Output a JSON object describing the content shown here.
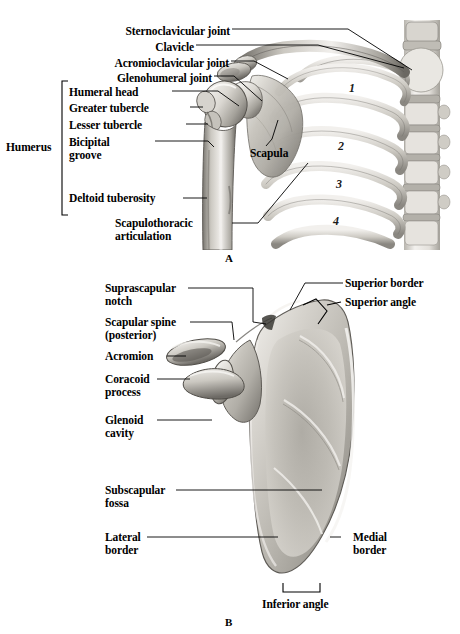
{
  "figure": {
    "title_hidden": "",
    "panels": [
      {
        "letter": "A",
        "name": "shoulder-girdle-anterior",
        "labels": [
          {
            "id": "sternoclavicular-joint",
            "text": "Sternoclavicular joint"
          },
          {
            "id": "clavicle",
            "text": "Clavicle"
          },
          {
            "id": "acromioclavicular-joint",
            "text": "Acromioclavicular joint"
          },
          {
            "id": "glenohumeral-joint",
            "text": "Glenohumeral joint"
          },
          {
            "id": "humeral-head",
            "text": "Humeral head"
          },
          {
            "id": "greater-tubercle",
            "text": "Greater tubercle"
          },
          {
            "id": "lesser-tubercle",
            "text": "Lesser tubercle"
          },
          {
            "id": "bicipital-groove-1",
            "text": "Bicipital"
          },
          {
            "id": "bicipital-groove-2",
            "text": "groove"
          },
          {
            "id": "deltoid-tuberosity",
            "text": "Deltoid tuberosity"
          },
          {
            "id": "scapulothoracic-1",
            "text": "Scapulothoracic"
          },
          {
            "id": "scapulothoracic-2",
            "text": "articulation"
          },
          {
            "id": "humerus-bracket",
            "text": "Humerus"
          },
          {
            "id": "scapula",
            "text": "Scapula"
          }
        ],
        "rib_numbers": [
          "1",
          "2",
          "3",
          "4"
        ]
      },
      {
        "letter": "B",
        "name": "scapula-anterior",
        "labels": [
          {
            "id": "suprascapular-notch-1",
            "text": "Suprascapular"
          },
          {
            "id": "suprascapular-notch-2",
            "text": "notch"
          },
          {
            "id": "scapular-spine-1",
            "text": "Scapular spine"
          },
          {
            "id": "scapular-spine-2",
            "text": "(posterior)"
          },
          {
            "id": "acromion",
            "text": "Acromion"
          },
          {
            "id": "coracoid-process-1",
            "text": "Coracoid"
          },
          {
            "id": "coracoid-process-2",
            "text": "process"
          },
          {
            "id": "glenoid-cavity-1",
            "text": "Glenoid"
          },
          {
            "id": "glenoid-cavity-2",
            "text": "cavity"
          },
          {
            "id": "subscapular-fossa-1",
            "text": "Subscapular"
          },
          {
            "id": "subscapular-fossa-2",
            "text": "fossa"
          },
          {
            "id": "lateral-border-1",
            "text": "Lateral"
          },
          {
            "id": "lateral-border-2",
            "text": "border"
          },
          {
            "id": "superior-border",
            "text": "Superior border"
          },
          {
            "id": "superior-angle",
            "text": "Superior angle"
          },
          {
            "id": "medial-border-1",
            "text": "Medial"
          },
          {
            "id": "medial-border-2",
            "text": "border"
          },
          {
            "id": "inferior-angle",
            "text": "Inferior angle"
          }
        ]
      }
    ]
  },
  "colors": {
    "background": "#ffffff",
    "ink": "#000000",
    "bone_light": "#efeeea",
    "bone_mid": "#c9c6bf",
    "bone_dark": "#8e8b85",
    "bone_shadow": "#5d5a55"
  }
}
